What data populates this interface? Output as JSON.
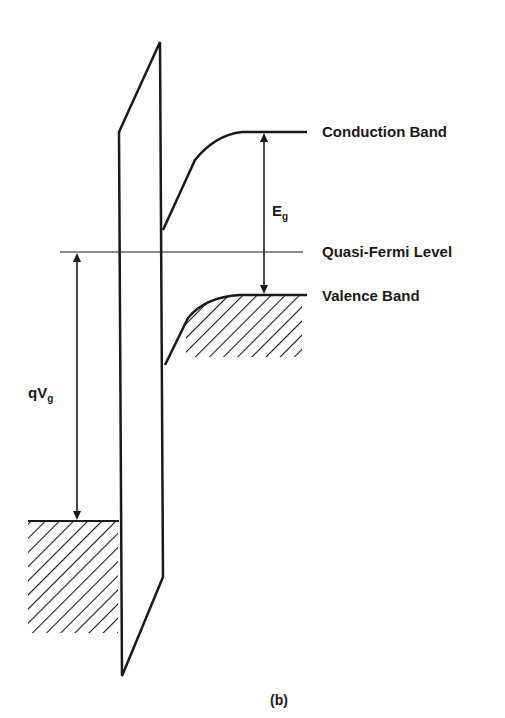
{
  "diagram": {
    "labels": {
      "conduction_band": "Conduction Band",
      "quasi_fermi_level": "Quasi-Fermi Level",
      "valence_band": "Valence Band",
      "bandgap_symbol": "E",
      "bandgap_subscript": "g",
      "gate_voltage_symbol": "qV",
      "gate_voltage_subscript": "g",
      "caption": "(b)"
    },
    "colors": {
      "line": "#1a1a1a",
      "background": "#ffffff"
    }
  }
}
